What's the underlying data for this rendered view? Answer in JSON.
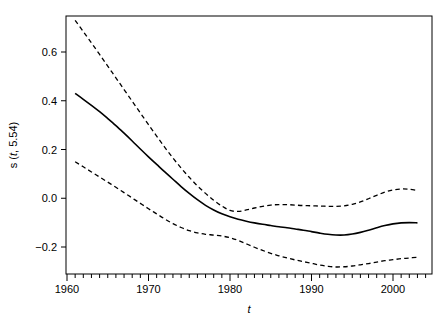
{
  "chart_data": {
    "type": "line",
    "title": "",
    "subtitle": "",
    "xlabel": "t",
    "ylabel": "s (t, 5.54)",
    "xlim": [
      1960.0,
      2004.8
    ],
    "ylim": [
      -0.29,
      0.74
    ],
    "grid": false,
    "legend": null,
    "x_ticks_major": [
      1960,
      1970,
      1980,
      1990,
      2000
    ],
    "x_tick_labels": [
      "1960",
      "1970",
      "1980",
      "1990",
      "2000"
    ],
    "x_ticks_minor_step": 1,
    "y_ticks": [
      -0.2,
      0.0,
      0.2,
      0.4,
      0.6
    ],
    "y_tick_labels": [
      "-0.2",
      "0.0",
      "0.2",
      "0.4",
      "0.6"
    ],
    "x": [
      1961,
      1962,
      1963,
      1964,
      1965,
      1966,
      1967,
      1968,
      1969,
      1970,
      1971,
      1972,
      1973,
      1974,
      1975,
      1976,
      1977,
      1978,
      1979,
      1980,
      1981,
      1982,
      1983,
      1984,
      1985,
      1986,
      1987,
      1988,
      1989,
      1990,
      1991,
      1992,
      1993,
      1994,
      1995,
      1996,
      1997,
      1998,
      1999,
      2000,
      2001,
      2002,
      2003
    ],
    "series": [
      {
        "name": "fit",
        "style": "solid",
        "color": "#000000",
        "width": 1.6,
        "values": [
          0.43,
          0.406,
          0.381,
          0.355,
          0.327,
          0.298,
          0.267,
          0.235,
          0.202,
          0.17,
          0.139,
          0.108,
          0.078,
          0.048,
          0.02,
          -0.006,
          -0.029,
          -0.048,
          -0.064,
          -0.076,
          -0.086,
          -0.094,
          -0.101,
          -0.107,
          -0.112,
          -0.117,
          -0.121,
          -0.126,
          -0.131,
          -0.137,
          -0.143,
          -0.148,
          -0.151,
          -0.151,
          -0.147,
          -0.14,
          -0.131,
          -0.121,
          -0.112,
          -0.105,
          -0.101,
          -0.1,
          -0.101
        ]
      },
      {
        "name": "upper confidence band",
        "style": "dashed",
        "color": "#000000",
        "width": 1.3,
        "values": [
          0.73,
          0.684,
          0.637,
          0.59,
          0.542,
          0.494,
          0.446,
          0.398,
          0.35,
          0.302,
          0.255,
          0.209,
          0.165,
          0.124,
          0.086,
          0.051,
          0.02,
          -0.008,
          -0.032,
          -0.05,
          -0.054,
          -0.048,
          -0.04,
          -0.033,
          -0.028,
          -0.026,
          -0.026,
          -0.028,
          -0.03,
          -0.031,
          -0.032,
          -0.033,
          -0.033,
          -0.031,
          -0.025,
          -0.015,
          -0.002,
          0.012,
          0.025,
          0.034,
          0.038,
          0.037,
          0.032
        ]
      },
      {
        "name": "lower confidence band",
        "style": "dashed",
        "color": "#000000",
        "width": 1.3,
        "values": [
          0.15,
          0.129,
          0.108,
          0.087,
          0.066,
          0.045,
          0.023,
          0.001,
          -0.021,
          -0.043,
          -0.064,
          -0.085,
          -0.104,
          -0.12,
          -0.133,
          -0.142,
          -0.148,
          -0.151,
          -0.155,
          -0.162,
          -0.173,
          -0.187,
          -0.201,
          -0.214,
          -0.226,
          -0.236,
          -0.245,
          -0.253,
          -0.26,
          -0.267,
          -0.274,
          -0.279,
          -0.282,
          -0.281,
          -0.278,
          -0.273,
          -0.268,
          -0.262,
          -0.256,
          -0.252,
          -0.248,
          -0.245,
          -0.242
        ]
      }
    ]
  }
}
